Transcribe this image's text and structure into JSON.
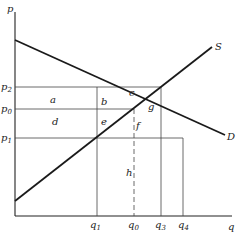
{
  "diagram": {
    "type": "supply-demand",
    "axes": {
      "y_label": "p",
      "x_label": "q"
    },
    "curves": [
      {
        "name": "demand",
        "label": "D"
      },
      {
        "name": "supply",
        "label": "S"
      }
    ],
    "price_levels": [
      {
        "id": "p2",
        "base": "p",
        "sub": "2"
      },
      {
        "id": "p0",
        "base": "p",
        "sub": "0"
      },
      {
        "id": "p1",
        "base": "p",
        "sub": "1"
      }
    ],
    "quantity_levels": [
      {
        "id": "q1",
        "base": "q",
        "sub": "1"
      },
      {
        "id": "q0",
        "base": "q",
        "sub": "0"
      },
      {
        "id": "q3",
        "base": "q",
        "sub": "3"
      },
      {
        "id": "q4",
        "base": "q",
        "sub": "4"
      }
    ],
    "region_labels": [
      "a",
      "b",
      "c",
      "d",
      "e",
      "f",
      "g",
      "h"
    ]
  }
}
